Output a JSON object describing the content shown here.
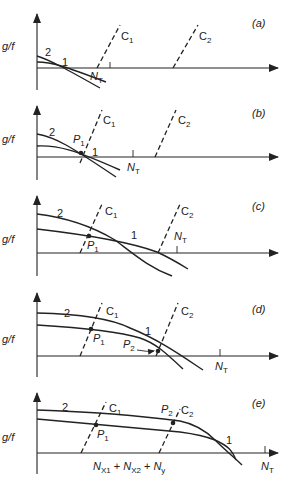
{
  "figure": {
    "y_axis_label": "g/f",
    "curve_labels": {
      "curve_1": "1",
      "curve_2": "2"
    },
    "line_labels": {
      "c1": "C",
      "c1_sub": "1",
      "c2": "C",
      "c2_sub": "2"
    },
    "point_labels": {
      "p1": "P",
      "p1_sub": "1",
      "p2": "P",
      "p2_sub": "2"
    },
    "nt_label": "N",
    "nt_sub": "T",
    "panels": [
      {
        "id": "a",
        "label": "(a)"
      },
      {
        "id": "b",
        "label": "(b)"
      },
      {
        "id": "c",
        "label": "(c)"
      },
      {
        "id": "d",
        "label": "(d)"
      },
      {
        "id": "e",
        "label": "(e)"
      }
    ],
    "sum_label": {
      "nx1": "N",
      "nx1_sub": "X1",
      "plus1": "+",
      "nx2": "N",
      "nx2_sub": "X2",
      "plus2": "+",
      "ny": "N",
      "ny_sub": "y"
    }
  }
}
